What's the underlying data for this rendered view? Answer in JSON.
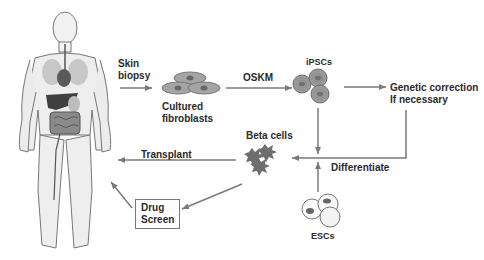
{
  "diagram": {
    "type": "flow",
    "nodes": {
      "human": {
        "name": "Human body"
      },
      "skin_biopsy": {
        "label_line1": "Skin",
        "label_line2": "biopsy"
      },
      "fibroblasts": {
        "label_line1": "Cultured",
        "label_line2": "fibroblasts"
      },
      "oskm": {
        "label": "OSKM"
      },
      "ipscs": {
        "label": "iPSCs"
      },
      "genetic": {
        "label_line1": "Genetic correction",
        "label_line2": "If necessary"
      },
      "beta": {
        "label": "Beta cells"
      },
      "transplant": {
        "label": "Transplant"
      },
      "differentiate": {
        "label": "Differentiate"
      },
      "drug": {
        "label_line1": "Drug",
        "label_line2": "Screen"
      },
      "escs": {
        "label": "ESCs"
      }
    },
    "edges": [
      {
        "from": "human",
        "to": "fibroblasts",
        "label": "Skin biopsy"
      },
      {
        "from": "fibroblasts",
        "to": "ipscs",
        "label": "OSKM"
      },
      {
        "from": "ipscs",
        "to": "genetic",
        "label": ""
      },
      {
        "from": "genetic",
        "to": "beta",
        "label": "Differentiate"
      },
      {
        "from": "ipscs",
        "to": "beta",
        "label": ""
      },
      {
        "from": "escs",
        "to": "beta",
        "label": ""
      },
      {
        "from": "beta",
        "to": "human",
        "label": "Transplant"
      },
      {
        "from": "beta",
        "to": "drug",
        "label": ""
      },
      {
        "from": "drug",
        "to": "human",
        "label": ""
      }
    ],
    "colors": {
      "arrow": "#7a7a7a",
      "cell_fill": "#9a9a9a",
      "nucleus": "#666666",
      "text": "#2a2a2a"
    }
  }
}
